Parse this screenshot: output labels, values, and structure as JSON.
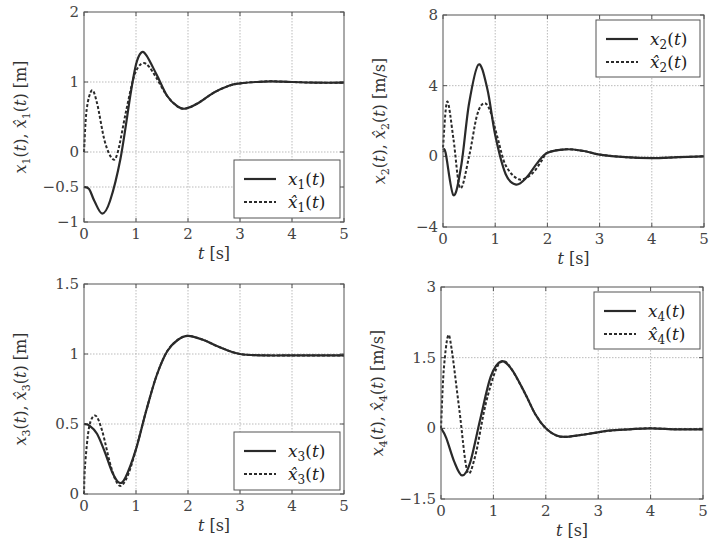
{
  "chart_data": [
    {
      "type": "line",
      "id": "x1",
      "xlabel": "t [s]",
      "ylabel": "x1(t), x̂1(t) [m]",
      "xlim": [
        0,
        5
      ],
      "ylim": [
        -1,
        2
      ],
      "xticks": [
        0,
        1,
        2,
        3,
        4,
        5
      ],
      "yticks": [
        2,
        1,
        0,
        -0.5,
        -1
      ],
      "ytick_labels": [
        "2",
        "1",
        "0",
        "−0.5",
        "−1"
      ],
      "grid": true,
      "legend_position": "lower right",
      "box": {
        "left": 84,
        "right": 344,
        "top": 12,
        "bottom": 222
      },
      "legend_box": {
        "x": 234,
        "y": 160,
        "w": 106,
        "h": 58
      },
      "series": [
        {
          "name": "x1(t)",
          "style": "solid",
          "x": [
            0,
            0.1,
            0.2,
            0.35,
            0.5,
            0.7,
            0.9,
            1.0,
            1.1,
            1.2,
            1.4,
            1.6,
            1.8,
            1.95,
            2.2,
            2.5,
            2.8,
            3.0,
            3.3,
            3.6,
            4.0,
            4.5,
            5.0
          ],
          "y": [
            -0.5,
            -0.53,
            -0.7,
            -0.88,
            -0.7,
            -0.1,
            0.85,
            1.25,
            1.42,
            1.38,
            1.1,
            0.8,
            0.65,
            0.62,
            0.7,
            0.85,
            0.95,
            0.98,
            1.0,
            1.01,
            1.0,
            0.99,
            0.99
          ]
        },
        {
          "name": "x̂1(t)",
          "style": "dashed",
          "x": [
            0,
            0.05,
            0.15,
            0.25,
            0.4,
            0.55,
            0.65,
            0.8,
            0.95,
            1.05,
            1.15,
            1.25,
            1.4,
            1.6,
            1.8,
            1.95,
            2.2,
            2.5,
            2.8,
            3.0,
            3.3,
            3.6,
            4.0,
            4.5,
            5.0
          ],
          "y": [
            0,
            0.6,
            0.88,
            0.7,
            0.15,
            -0.1,
            0.0,
            0.55,
            1.05,
            1.22,
            1.27,
            1.22,
            1.05,
            0.8,
            0.65,
            0.62,
            0.7,
            0.85,
            0.95,
            0.98,
            1.0,
            1.01,
            1.0,
            0.99,
            0.99
          ]
        }
      ],
      "legend": {
        "entries": [
          "x1(t)",
          "x̂1(t)"
        ]
      }
    },
    {
      "type": "line",
      "id": "x2",
      "xlabel": "t [s]",
      "ylabel": "x2(t), x̂2(t) [m/s]",
      "xlim": [
        0,
        5
      ],
      "ylim": [
        -4,
        8
      ],
      "xticks": [
        0,
        1,
        2,
        3,
        4,
        5
      ],
      "yticks": [
        8,
        4,
        0,
        -4
      ],
      "ytick_labels": [
        "8",
        "4",
        "0",
        "−4"
      ],
      "grid": true,
      "legend_position": "upper right",
      "box": {
        "left": 443,
        "right": 704,
        "top": 15,
        "bottom": 227
      },
      "legend_box": {
        "x": 596,
        "y": 20,
        "w": 104,
        "h": 57
      },
      "series": [
        {
          "name": "x2(t)",
          "style": "solid",
          "x": [
            0,
            0.05,
            0.2,
            0.35,
            0.5,
            0.68,
            0.85,
            1.0,
            1.2,
            1.4,
            1.6,
            1.8,
            2.0,
            2.35,
            2.7,
            3.0,
            3.5,
            4.0,
            4.5,
            5.0
          ],
          "y": [
            0.3,
            0.2,
            -2.2,
            -0.5,
            3.0,
            5.2,
            3.8,
            1.2,
            -1.0,
            -1.6,
            -1.2,
            -0.4,
            0.2,
            0.4,
            0.3,
            0.1,
            -0.05,
            -0.1,
            -0.05,
            0.0
          ]
        },
        {
          "name": "x̂2(t)",
          "style": "dashed",
          "x": [
            0,
            0.08,
            0.2,
            0.33,
            0.5,
            0.65,
            0.78,
            0.9,
            1.05,
            1.2,
            1.45,
            1.7,
            1.9,
            2.0,
            2.35,
            2.7,
            3.0,
            3.5,
            4.0,
            4.5,
            5.0
          ],
          "y": [
            0.5,
            3.1,
            1.0,
            -1.8,
            0.0,
            2.3,
            3.0,
            2.6,
            1.0,
            -0.5,
            -1.3,
            -1.0,
            -0.2,
            0.2,
            0.4,
            0.3,
            0.1,
            -0.05,
            -0.1,
            -0.05,
            0.0
          ]
        }
      ],
      "legend": {
        "entries": [
          "x2(t)",
          "x̂2(t)"
        ]
      }
    },
    {
      "type": "line",
      "id": "x3",
      "xlabel": "t [s]",
      "ylabel": "x3(t), x̂3(t) [m]",
      "xlim": [
        0,
        5
      ],
      "ylim": [
        0,
        1.5
      ],
      "xticks": [
        0,
        1,
        2,
        3,
        4,
        5
      ],
      "yticks": [
        1.5,
        1,
        0.5,
        0
      ],
      "ytick_labels": [
        "1.5",
        "1",
        "0.5",
        "0"
      ],
      "grid": true,
      "legend_position": "lower right",
      "box": {
        "left": 84,
        "right": 344,
        "top": 284,
        "bottom": 494
      },
      "legend_box": {
        "x": 234,
        "y": 432,
        "w": 106,
        "h": 58
      },
      "series": [
        {
          "name": "x3(t)",
          "style": "solid",
          "x": [
            0,
            0.1,
            0.25,
            0.4,
            0.55,
            0.68,
            0.8,
            1.0,
            1.2,
            1.4,
            1.6,
            1.8,
            2.0,
            2.3,
            2.6,
            3.0,
            3.5,
            4.0,
            4.5,
            5.0
          ],
          "y": [
            0.5,
            0.49,
            0.43,
            0.3,
            0.15,
            0.08,
            0.12,
            0.32,
            0.6,
            0.85,
            1.02,
            1.1,
            1.13,
            1.1,
            1.05,
            1.0,
            0.99,
            0.99,
            0.99,
            0.99
          ]
        },
        {
          "name": "x̂3(t)",
          "style": "dashed",
          "x": [
            0,
            0.02,
            0.1,
            0.22,
            0.35,
            0.5,
            0.62,
            0.72,
            0.85,
            1.0,
            1.2,
            1.4,
            1.6,
            1.8,
            2.0,
            2.3,
            2.6,
            3.0,
            3.5,
            4.0,
            4.5,
            5.0
          ],
          "y": [
            0,
            0.2,
            0.48,
            0.56,
            0.45,
            0.22,
            0.09,
            0.06,
            0.14,
            0.32,
            0.6,
            0.85,
            1.02,
            1.1,
            1.13,
            1.1,
            1.05,
            1.0,
            0.99,
            0.99,
            0.99,
            0.99
          ]
        }
      ],
      "legend": {
        "entries": [
          "x3(t)",
          "x̂3(t)"
        ]
      }
    },
    {
      "type": "line",
      "id": "x4",
      "xlabel": "t [s]",
      "ylabel": "x4(t), x̂4(t) [m/s]",
      "xlim": [
        0,
        5
      ],
      "ylim": [
        -1.5,
        3
      ],
      "xticks": [
        0,
        1,
        2,
        3,
        4,
        5
      ],
      "yticks": [
        3,
        1.5,
        0,
        -1.5
      ],
      "ytick_labels": [
        "3",
        "1.5",
        "0",
        "−1.5"
      ],
      "grid": true,
      "legend_position": "upper right",
      "box": {
        "left": 441,
        "right": 703,
        "top": 287,
        "bottom": 499
      },
      "legend_box": {
        "x": 594,
        "y": 292,
        "w": 106,
        "h": 57
      },
      "series": [
        {
          "name": "x4(t)",
          "style": "solid",
          "x": [
            0,
            0.1,
            0.25,
            0.4,
            0.55,
            0.75,
            0.95,
            1.15,
            1.35,
            1.6,
            1.8,
            2.0,
            2.2,
            2.4,
            2.8,
            3.2,
            3.6,
            4.0,
            4.5,
            5.0
          ],
          "y": [
            0,
            -0.2,
            -0.7,
            -1.0,
            -0.75,
            0.2,
            1.1,
            1.42,
            1.25,
            0.75,
            0.3,
            0.0,
            -0.15,
            -0.18,
            -0.12,
            -0.05,
            -0.02,
            0.0,
            -0.02,
            -0.02
          ]
        },
        {
          "name": "x̂4(t)",
          "style": "dashed",
          "x": [
            0,
            0.05,
            0.13,
            0.2,
            0.35,
            0.5,
            0.65,
            0.85,
            1.05,
            1.2,
            1.35,
            1.6,
            1.8,
            2.0,
            2.2,
            2.4,
            2.8,
            3.2,
            3.6,
            4.0,
            4.5,
            5.0
          ],
          "y": [
            0,
            1.2,
            1.95,
            1.7,
            0.4,
            -0.9,
            -0.6,
            0.5,
            1.25,
            1.42,
            1.25,
            0.75,
            0.3,
            0.0,
            -0.15,
            -0.18,
            -0.12,
            -0.05,
            -0.02,
            0.0,
            -0.02,
            -0.02
          ]
        }
      ],
      "legend": {
        "entries": [
          "x4(t)",
          "x̂4(t)"
        ]
      }
    }
  ],
  "panels": [
    {
      "ylabel_var": "x",
      "sub": "1",
      "unit": "[m]",
      "xlabel_var": "t",
      "xlabel_unit": "[s]"
    },
    {
      "ylabel_var": "x",
      "sub": "2",
      "unit": "[m/s]",
      "xlabel_var": "t",
      "xlabel_unit": "[s]"
    },
    {
      "ylabel_var": "x",
      "sub": "3",
      "unit": "[m]",
      "xlabel_var": "t",
      "xlabel_unit": "[s]"
    },
    {
      "ylabel_var": "x",
      "sub": "4",
      "unit": "[m/s]",
      "xlabel_var": "t",
      "xlabel_unit": "[s]"
    }
  ],
  "colors": {
    "line": "#2a2a2a",
    "grid": "#aaaaaa",
    "frame": "#555555",
    "text": "#333333"
  }
}
